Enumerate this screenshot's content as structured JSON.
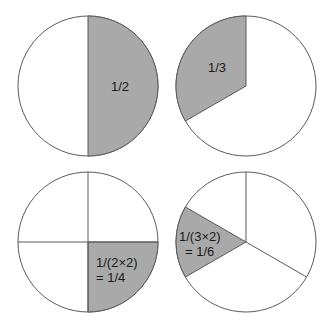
{
  "colors": {
    "shade": "#a9a9a9",
    "stroke": "#5a5a5a",
    "background": "#ffffff"
  },
  "pies": [
    {
      "name": "half",
      "label_lines": [
        "1/2"
      ],
      "fraction": "1/2"
    },
    {
      "name": "third",
      "label_lines": [
        "1/3"
      ],
      "fraction": "1/3"
    },
    {
      "name": "quarter",
      "label_lines": [
        "1/(2×2)",
        "= 1/4"
      ],
      "fraction": "1/4"
    },
    {
      "name": "sixth",
      "label_lines": [
        "1/(3×2)",
        "= 1/6"
      ],
      "fraction": "1/6"
    }
  ]
}
